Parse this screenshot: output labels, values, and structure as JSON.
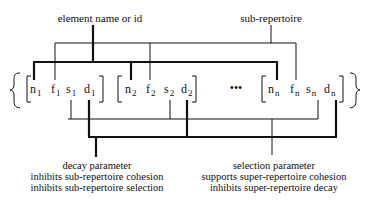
{
  "labels": {
    "top_left": "element name or id",
    "top_right": "sub-repertoire"
  },
  "repertoire": {
    "open_brace": "{",
    "close_brace": "}",
    "ellipsis": "•••",
    "groups": [
      {
        "index": "1",
        "elements": [
          {
            "symbol": "n",
            "sub": "1"
          },
          {
            "symbol": "f",
            "sub": "1"
          },
          {
            "symbol": "s",
            "sub": "1"
          },
          {
            "symbol": "d",
            "sub": "1"
          }
        ]
      },
      {
        "index": "2",
        "elements": [
          {
            "symbol": "n",
            "sub": "2"
          },
          {
            "symbol": "f",
            "sub": "2"
          },
          {
            "symbol": "s",
            "sub": "2"
          },
          {
            "symbol": "d",
            "sub": "2"
          }
        ]
      },
      {
        "index": "n",
        "elements": [
          {
            "symbol": "n",
            "sub": "n"
          },
          {
            "symbol": "f",
            "sub": "n"
          },
          {
            "symbol": "s",
            "sub": "n"
          },
          {
            "symbol": "d",
            "sub": "n"
          }
        ]
      }
    ]
  },
  "captions": {
    "decay": {
      "title": "decay parameter",
      "line1": "inhibits sub-repertoire cohesion",
      "line2": "inhibits sub-repertoire selection"
    },
    "selection": {
      "title": "selection parameter",
      "line1": "supports super-repertoire cohesion",
      "line2": "inhibits super-repertoire decay"
    }
  },
  "colors": {
    "ink": "#111111",
    "background": "#ffffff"
  }
}
